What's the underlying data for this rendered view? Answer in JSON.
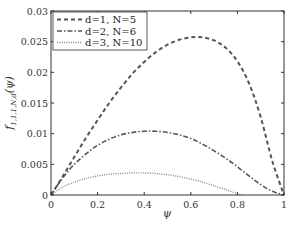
{
  "chart_data": {
    "type": "line",
    "title": "",
    "xlabel": "ψ",
    "ylabel": "f1,1,1,N,d(ψ)",
    "xlim": [
      0,
      1
    ],
    "ylim": [
      0,
      0.03
    ],
    "xticks": [
      "0",
      "0.2",
      "0.4",
      "0.6",
      "0.8",
      "1"
    ],
    "yticks": [
      "0",
      "0.005",
      "0.01",
      "0.015",
      "0.02",
      "0.025",
      "0.03"
    ],
    "grid": false,
    "legend_position": "upper left",
    "series": [
      {
        "name": "d=1, N=5",
        "style": "dashed",
        "color": "#555555",
        "x": [
          0,
          0.05,
          0.1,
          0.15,
          0.2,
          0.25,
          0.3,
          0.35,
          0.4,
          0.45,
          0.5,
          0.55,
          0.6,
          0.65,
          0.7,
          0.75,
          0.8,
          0.85,
          0.9,
          0.95,
          1.0
        ],
        "y": [
          0,
          0.003,
          0.0062,
          0.0093,
          0.0122,
          0.015,
          0.0175,
          0.0198,
          0.0217,
          0.0233,
          0.0245,
          0.0253,
          0.0257,
          0.0257,
          0.0252,
          0.024,
          0.0218,
          0.0182,
          0.0127,
          0.0055,
          0
        ]
      },
      {
        "name": "d=2, N=6",
        "style": "dashdot",
        "color": "#555555",
        "x": [
          0,
          0.05,
          0.1,
          0.15,
          0.2,
          0.25,
          0.3,
          0.35,
          0.4,
          0.45,
          0.5,
          0.55,
          0.6,
          0.65,
          0.7,
          0.75,
          0.8,
          0.85,
          0.9,
          0.95,
          1.0
        ],
        "y": [
          0,
          0.0028,
          0.005,
          0.0067,
          0.0081,
          0.0091,
          0.0098,
          0.0102,
          0.0104,
          0.0104,
          0.0102,
          0.0098,
          0.0092,
          0.0083,
          0.0072,
          0.006,
          0.0046,
          0.0031,
          0.0017,
          0.0006,
          0
        ]
      },
      {
        "name": "d=3, N=10",
        "style": "dotted",
        "color": "#888888",
        "x": [
          0,
          0.05,
          0.1,
          0.15,
          0.2,
          0.25,
          0.3,
          0.35,
          0.4,
          0.45,
          0.5,
          0.55,
          0.6,
          0.65,
          0.7,
          0.75,
          0.8,
          0.82
        ],
        "y": [
          0,
          0.0013,
          0.0021,
          0.0027,
          0.0031,
          0.0034,
          0.0035,
          0.0036,
          0.0036,
          0.0035,
          0.0033,
          0.003,
          0.0026,
          0.0021,
          0.0015,
          0.0009,
          0.0002,
          0
        ]
      }
    ]
  }
}
